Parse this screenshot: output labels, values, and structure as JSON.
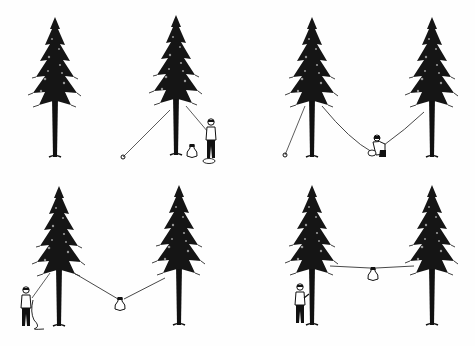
{
  "illustration": {
    "subject": "Steps for hanging a food bag between two trees",
    "background": "#ffffff",
    "ink": "#111111",
    "panels": [
      {
        "step": 1,
        "description": "Person throws rope over first tree branch; rope anchored on ground, bag on ground",
        "position": "top-left"
      },
      {
        "step": 2,
        "description": "Rope strung between two trees; person crouching ties bag to middle of rope",
        "position": "top-right"
      },
      {
        "step": 3,
        "description": "Person pulls rope, bag lifted partway between trees",
        "position": "bottom-left"
      },
      {
        "step": 4,
        "description": "Bag hung high between trees; person ties off rope at tree trunk",
        "position": "bottom-right"
      }
    ]
  }
}
